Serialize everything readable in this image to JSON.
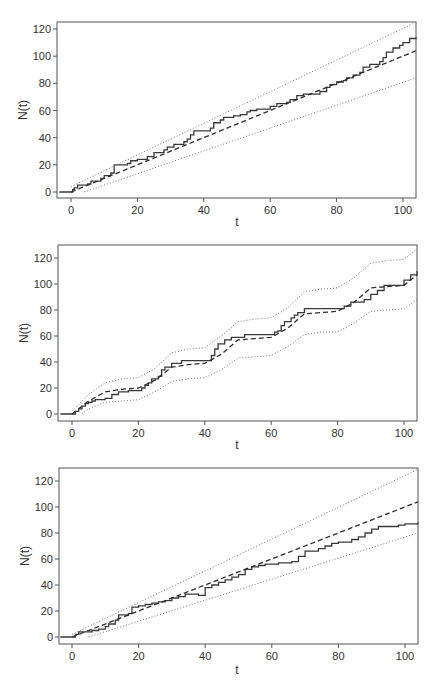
{
  "chart_data": [
    {
      "type": "line",
      "panel": 1,
      "title": "",
      "xlabel": "t",
      "ylabel": "N(t)",
      "xlim": [
        -3.5,
        104
      ],
      "ylim": [
        -4,
        125
      ],
      "xticks": [
        0,
        20,
        40,
        60,
        80,
        100
      ],
      "yticks": [
        0,
        20,
        40,
        60,
        80,
        100,
        120
      ],
      "grid": false,
      "legend": null,
      "series": [
        {
          "name": "observed counting process",
          "style": "step-solid",
          "x": [
            -3.5,
            0,
            0.5,
            1,
            2,
            3,
            5,
            6,
            8,
            9,
            10,
            12,
            13,
            15,
            17,
            18,
            20,
            22,
            23,
            25,
            26,
            28,
            29,
            31,
            32,
            34,
            35,
            36,
            37,
            39,
            41,
            42,
            43,
            45,
            46,
            47,
            49,
            51,
            53,
            54,
            56,
            58,
            60,
            62,
            63,
            65,
            66,
            68,
            70,
            71,
            73,
            75,
            77,
            78,
            80,
            82,
            83,
            85,
            87,
            88,
            90,
            91,
            93,
            94,
            95,
            97,
            99,
            100,
            102,
            104
          ],
          "y": [
            0,
            0,
            2,
            3,
            5,
            5,
            6,
            8,
            8,
            10,
            12,
            14,
            20,
            20,
            21,
            23,
            24,
            24,
            26,
            29,
            29,
            31,
            33,
            35,
            35,
            37,
            39,
            42,
            45,
            45,
            45,
            47,
            51,
            53,
            55,
            55,
            56,
            57,
            59,
            60,
            61,
            61,
            63,
            65,
            65,
            66,
            68,
            71,
            72,
            72,
            72,
            74,
            77,
            79,
            81,
            82,
            84,
            86,
            88,
            92,
            94,
            94,
            96,
            99,
            103,
            106,
            108,
            110,
            113,
            114
          ]
        },
        {
          "name": "expected mean",
          "style": "dashed",
          "x": [
            0,
            104
          ],
          "y": [
            0,
            104
          ]
        },
        {
          "name": "upper bound",
          "style": "dotted",
          "x": [
            0,
            104
          ],
          "y": [
            4,
            125
          ]
        },
        {
          "name": "lower bound",
          "style": "dotted",
          "x": [
            4,
            104
          ],
          "y": [
            0,
            84
          ]
        }
      ]
    },
    {
      "type": "line",
      "panel": 2,
      "title": "",
      "xlabel": "t",
      "ylabel": "N(t)",
      "xlim": [
        -3.5,
        104
      ],
      "ylim": [
        -4,
        125
      ],
      "xticks": [
        0,
        20,
        40,
        60,
        80,
        100
      ],
      "yticks": [
        0,
        20,
        40,
        60,
        80,
        100,
        120
      ],
      "grid": false,
      "legend": null,
      "series": [
        {
          "name": "observed counting process",
          "style": "step-solid",
          "x": [
            -3.5,
            0,
            1,
            2,
            3,
            4,
            5,
            6,
            7,
            10,
            12,
            14,
            17,
            20,
            21,
            22,
            23,
            24,
            26,
            27,
            28,
            30,
            33,
            41,
            42,
            43,
            44,
            46,
            48,
            52,
            60,
            61,
            62,
            63,
            64,
            66,
            67,
            68,
            70,
            80,
            82,
            84,
            86,
            88,
            90,
            92,
            94,
            99,
            100,
            102,
            104
          ],
          "y": [
            0,
            0,
            2,
            4,
            6,
            8,
            9,
            10,
            11,
            12,
            15,
            17,
            18,
            18,
            20,
            22,
            24,
            27,
            29,
            34,
            36,
            39,
            41,
            41,
            45,
            50,
            54,
            57,
            59,
            61,
            61,
            63,
            64,
            68,
            71,
            74,
            76,
            78,
            81,
            81,
            83,
            86,
            86,
            88,
            92,
            95,
            99,
            99,
            103,
            107,
            110
          ]
        },
        {
          "name": "expected mean",
          "style": "dashed",
          "x": [
            0,
            5,
            10,
            15,
            20,
            25,
            30,
            35,
            40,
            45,
            50,
            55,
            60,
            65,
            70,
            75,
            80,
            85,
            90,
            95,
            100,
            104
          ],
          "y": [
            0,
            10,
            17,
            19,
            20,
            26,
            36,
            38,
            39,
            46,
            57,
            58,
            59,
            66,
            77,
            78,
            79,
            86,
            97,
            98,
            99,
            107
          ]
        },
        {
          "name": "upper bound",
          "style": "dotted",
          "x": [
            0,
            5,
            10,
            15,
            20,
            25,
            30,
            35,
            40,
            45,
            50,
            55,
            60,
            65,
            70,
            75,
            80,
            85,
            90,
            95,
            100,
            104
          ],
          "y": [
            2,
            15,
            24,
            27,
            28,
            35,
            47,
            50,
            51,
            60,
            71,
            73,
            74,
            82,
            94,
            96,
            97,
            105,
            116,
            118,
            119,
            127
          ]
        },
        {
          "name": "lower bound",
          "style": "dotted",
          "x": [
            3,
            5,
            10,
            15,
            20,
            25,
            30,
            35,
            40,
            45,
            50,
            55,
            60,
            65,
            70,
            75,
            80,
            85,
            90,
            95,
            100,
            104
          ],
          "y": [
            0,
            4,
            9,
            10,
            11,
            17,
            25,
            27,
            28,
            34,
            43,
            44,
            45,
            52,
            61,
            63,
            63,
            70,
            79,
            80,
            81,
            88
          ]
        }
      ]
    },
    {
      "type": "line",
      "panel": 3,
      "title": "",
      "xlabel": "t",
      "ylabel": "N(t)",
      "xlim": [
        -3.5,
        104
      ],
      "ylim": [
        -4,
        125
      ],
      "xticks": [
        0,
        20,
        40,
        60,
        80,
        100
      ],
      "yticks": [
        0,
        20,
        40,
        60,
        80,
        100,
        120
      ],
      "grid": false,
      "legend": null,
      "series": [
        {
          "name": "observed counting process",
          "style": "step-solid",
          "x": [
            -3.5,
            0,
            1,
            2,
            4,
            6,
            8,
            10,
            11,
            13,
            14,
            17,
            18,
            20,
            22,
            24,
            26,
            28,
            30,
            32,
            34,
            36,
            38,
            40,
            42,
            44,
            46,
            48,
            50,
            52,
            54,
            56,
            58,
            62,
            66,
            68,
            70,
            72,
            74,
            76,
            78,
            80,
            82,
            84,
            86,
            88,
            90,
            92,
            96,
            98,
            100,
            104
          ],
          "y": [
            0,
            0,
            2,
            4,
            4,
            5,
            6,
            8,
            10,
            13,
            17,
            18,
            23,
            24,
            25,
            26,
            27,
            28,
            30,
            31,
            33,
            33,
            32,
            38,
            40,
            42,
            44,
            46,
            48,
            52,
            54,
            55,
            56,
            57,
            58,
            62,
            66,
            66,
            68,
            70,
            72,
            73,
            73,
            75,
            77,
            80,
            83,
            85,
            85,
            86,
            87,
            88
          ]
        },
        {
          "name": "expected mean",
          "style": "dashed",
          "x": [
            0,
            104
          ],
          "y": [
            0,
            104
          ]
        },
        {
          "name": "upper bound",
          "style": "dotted",
          "x": [
            0,
            104
          ],
          "y": [
            2,
            129
          ]
        },
        {
          "name": "lower bound",
          "style": "dotted",
          "x": [
            5,
            104
          ],
          "y": [
            0,
            80
          ]
        }
      ]
    }
  ],
  "panels": [
    {
      "ylabel": "N(t)",
      "xlabel": "t",
      "xtick_labels": [
        "0",
        "20",
        "40",
        "60",
        "80",
        "100"
      ],
      "ytick_labels": [
        "0",
        "20",
        "40",
        "60",
        "80",
        "100",
        "120"
      ]
    },
    {
      "ylabel": "N(t)",
      "xlabel": "t",
      "xtick_labels": [
        "0",
        "20",
        "40",
        "60",
        "80",
        "100"
      ],
      "ytick_labels": [
        "0",
        "20",
        "40",
        "60",
        "80",
        "100",
        "120"
      ]
    },
    {
      "ylabel": "N(t)",
      "xlabel": "t",
      "xtick_labels": [
        "0",
        "20",
        "40",
        "60",
        "80",
        "100"
      ],
      "ytick_labels": [
        "0",
        "20",
        "40",
        "60",
        "80",
        "100",
        "120"
      ]
    }
  ],
  "colors": {
    "observed": "#3a3a3a",
    "mean": "#2e2e2e",
    "bounds": "#777777",
    "axis": "#555555",
    "text": "#333333"
  }
}
